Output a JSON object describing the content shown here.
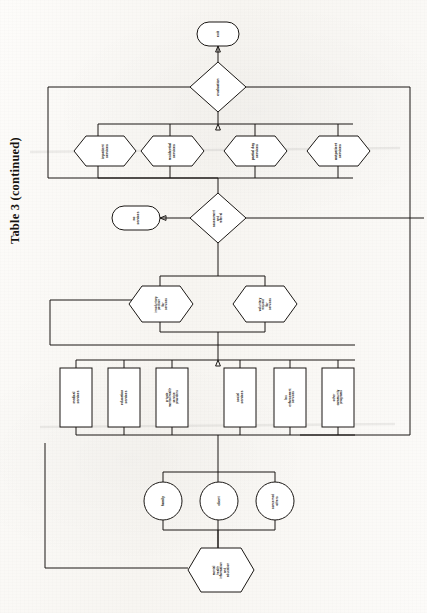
{
  "page": {
    "caption": "Table 3  (continued)",
    "orientation": "rotated-90-ccw",
    "ink_color": "#1a1714",
    "paper_color": "#fbfaf8"
  },
  "diagram": {
    "type": "flowchart",
    "nodes": [
      {
        "id": "exit",
        "shape": "terminator",
        "label": "exit"
      },
      {
        "id": "evaluation",
        "shape": "decision",
        "label": "evaluation"
      },
      {
        "id": "inpatient",
        "shape": "hexagon",
        "label": "inpatient\nservices"
      },
      {
        "id": "residential",
        "shape": "hexagon",
        "label": "residential\nservices"
      },
      {
        "id": "partial_day",
        "shape": "hexagon",
        "label": "partial day\nservices"
      },
      {
        "id": "outpatient",
        "shape": "hexagon",
        "label": "outpatient\nservices"
      },
      {
        "id": "assessment",
        "shape": "decision",
        "label": "assessment\nand\nreferral"
      },
      {
        "id": "no_services",
        "shape": "terminator",
        "label": "no\nservices"
      },
      {
        "id": "involuntary",
        "shape": "hexagon",
        "label": "involuntary\npetition\nfor\nservices"
      },
      {
        "id": "voluntary",
        "shape": "hexagon",
        "label": "voluntary\nrequest\nfor\nservices"
      },
      {
        "id": "medical",
        "shape": "process",
        "label": "medical\nservices"
      },
      {
        "id": "education",
        "shape": "process",
        "label": "education\nservices"
      },
      {
        "id": "private_mh",
        "shape": "process",
        "label": "private\nmental health\nservice\nproviders"
      },
      {
        "id": "social",
        "shape": "process",
        "label": "social\nservices"
      },
      {
        "id": "law_enforcement",
        "shape": "process",
        "label": "law\nenforcement\nservices"
      },
      {
        "id": "other_community",
        "shape": "process",
        "label": "other\ncommunity\nprograms"
      },
      {
        "id": "family",
        "shape": "circle",
        "label": "family"
      },
      {
        "id": "client",
        "shape": "circle",
        "label": "client"
      },
      {
        "id": "concerned",
        "shape": "circle",
        "label": "concerned\nothers"
      },
      {
        "id": "mh_info",
        "shape": "hexagon",
        "label": "mental\nhealth\ninformation\nand\neducation"
      }
    ],
    "edges": [
      {
        "from": "evaluation",
        "to": "exit",
        "label": ""
      },
      {
        "from": "inpatient",
        "to": "evaluation",
        "label": ""
      },
      {
        "from": "residential",
        "to": "evaluation",
        "label": ""
      },
      {
        "from": "partial_day",
        "to": "evaluation",
        "label": ""
      },
      {
        "from": "outpatient",
        "to": "evaluation",
        "label": ""
      },
      {
        "from": "assessment",
        "to": "inpatient",
        "label": ""
      },
      {
        "from": "assessment",
        "to": "residential",
        "label": ""
      },
      {
        "from": "assessment",
        "to": "partial_day",
        "label": ""
      },
      {
        "from": "assessment",
        "to": "outpatient",
        "label": ""
      },
      {
        "from": "assessment",
        "to": "no_services",
        "label": ""
      },
      {
        "from": "involuntary",
        "to": "assessment",
        "label": ""
      },
      {
        "from": "voluntary",
        "to": "assessment",
        "label": ""
      },
      {
        "from": "medical",
        "to": "involuntary",
        "label": ""
      },
      {
        "from": "education",
        "to": "voluntary",
        "label": ""
      },
      {
        "from": "private_mh",
        "to": "voluntary",
        "label": ""
      },
      {
        "from": "social",
        "to": "voluntary",
        "label": ""
      },
      {
        "from": "law_enforcement",
        "to": "involuntary",
        "label": ""
      },
      {
        "from": "other_community",
        "to": "voluntary",
        "label": ""
      },
      {
        "from": "family",
        "to": "medical",
        "label": ""
      },
      {
        "from": "client",
        "to": "private_mh",
        "label": ""
      },
      {
        "from": "concerned",
        "to": "social",
        "label": ""
      },
      {
        "from": "mh_info",
        "to": "client",
        "label": ""
      },
      {
        "from": "evaluation",
        "to": "mh_info",
        "label": "feedback loop"
      }
    ]
  }
}
